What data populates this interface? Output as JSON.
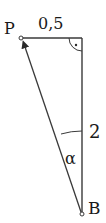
{
  "diagram": {
    "type": "right-triangle",
    "points": {
      "P": {
        "label": "P",
        "x": 21,
        "y": 38
      },
      "C": {
        "label": "",
        "x": 82,
        "y": 38
      },
      "B": {
        "label": "B",
        "x": 82,
        "y": 214
      }
    },
    "edges": [
      {
        "from": "P",
        "to": "C",
        "label": "0,5"
      },
      {
        "from": "C",
        "to": "B",
        "label": "2"
      },
      {
        "from": "B",
        "to": "P",
        "label": "",
        "arrow": "toward P"
      }
    ],
    "angle_label": "α",
    "right_angle_at": "C",
    "colors": {
      "stroke": "#3a3a3a",
      "text": "#1a1a1a",
      "background": "#ffffff"
    }
  }
}
